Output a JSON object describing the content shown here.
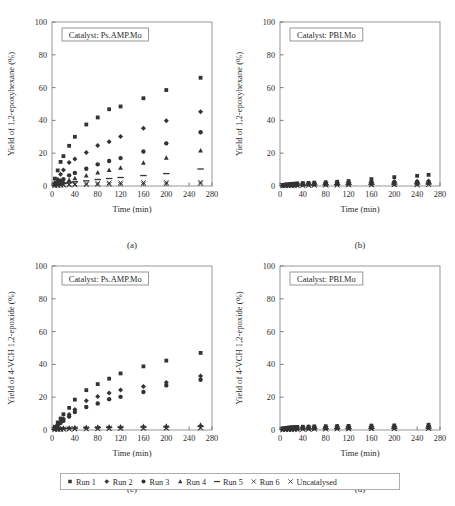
{
  "figure": {
    "background": "#ffffff",
    "marker_color": "#333333",
    "axis_color": "#8d8d8d"
  },
  "legend": {
    "items": [
      {
        "label": "Run 1",
        "marker": "square"
      },
      {
        "label": "Run 2",
        "marker": "diamond"
      },
      {
        "label": "Run 3",
        "marker": "circle"
      },
      {
        "label": "Run 4",
        "marker": "triangle"
      },
      {
        "label": "Run 5",
        "marker": "dash"
      },
      {
        "label": "Run 6",
        "marker": "cross"
      },
      {
        "label": "Uncatalysed",
        "marker": "cross"
      }
    ]
  },
  "panels": [
    {
      "letter": "(a)",
      "catalyst_label": "Catalyst: Ps.AMP.Mo",
      "chart_data": {
        "type": "scatter",
        "title": "",
        "xlabel": "Time (min)",
        "ylabel": "Yield of 1,2-epoxyhexane (%)",
        "xlim": [
          0,
          280
        ],
        "ylim": [
          0,
          100
        ],
        "xticks": [
          0,
          40,
          80,
          120,
          160,
          200,
          240,
          280
        ],
        "yticks": [
          0,
          20,
          40,
          60,
          80,
          100
        ],
        "grid": false,
        "legend_position": "below-figure",
        "x": [
          5,
          10,
          15,
          20,
          30,
          40,
          60,
          80,
          100,
          120,
          160,
          200,
          260
        ],
        "series": [
          {
            "name": "Run 1",
            "marker": "square",
            "values": [
              4.5,
              9.5,
              14.7,
              18.2,
              24.5,
              30.0,
              37.5,
              41.8,
              46.8,
              48.5,
              53.5,
              58.5,
              66.0
            ]
          },
          {
            "name": "Run 2",
            "marker": "diamond",
            "values": [
              2.0,
              4.0,
              7.2,
              9.8,
              14.4,
              16.5,
              20.5,
              24.7,
              27.0,
              30.2,
              35.2,
              39.8,
              45.3
            ]
          },
          {
            "name": "Run 3",
            "marker": "circle",
            "values": [
              1.2,
              2.2,
              3.2,
              4.2,
              6.5,
              8.0,
              10.5,
              13.2,
              15.2,
              17.0,
              21.0,
              26.0,
              32.8
            ]
          },
          {
            "name": "Run 4",
            "marker": "triangle",
            "values": [
              0.8,
              1.4,
              2.0,
              2.6,
              3.6,
              4.8,
              6.4,
              8.2,
              9.7,
              11.2,
              14.2,
              17.2,
              21.6
            ]
          },
          {
            "name": "Run 5",
            "marker": "dash",
            "values": [
              0.4,
              0.8,
              1.1,
              1.5,
              2.0,
              2.6,
              3.2,
              4.0,
              4.6,
              5.2,
              6.4,
              7.6,
              10.4
            ]
          },
          {
            "name": "Run 6",
            "marker": "cross",
            "values": [
              0.3,
              0.5,
              0.7,
              0.9,
              1.1,
              1.3,
              1.5,
              1.7,
              1.9,
              2.0,
              2.1,
              2.2,
              2.3
            ]
          },
          {
            "name": "Uncatalysed",
            "marker": "cross",
            "values": [
              0.2,
              0.3,
              0.4,
              0.5,
              0.6,
              0.7,
              0.8,
              0.9,
              1.0,
              1.1,
              1.2,
              1.3,
              1.4
            ]
          }
        ]
      }
    },
    {
      "letter": "(b)",
      "catalyst_label": "Catalyst: PBI.Mo",
      "chart_data": {
        "type": "scatter",
        "title": "",
        "xlabel": "Time (min)",
        "ylabel": "Yield of 1,2-epoxyhexane (%)",
        "xlim": [
          0,
          280
        ],
        "ylim": [
          0,
          100
        ],
        "xticks": [
          0,
          40,
          80,
          120,
          160,
          200,
          240,
          280
        ],
        "yticks": [
          0,
          20,
          40,
          60,
          80,
          100
        ],
        "grid": false,
        "legend_position": "below-figure",
        "x": [
          5,
          10,
          15,
          20,
          25,
          30,
          40,
          50,
          60,
          80,
          100,
          120,
          160,
          200,
          240,
          260
        ],
        "series": [
          {
            "name": "Run 1",
            "marker": "square",
            "values": [
              0.6,
              0.9,
              1.1,
              1.3,
              1.4,
              1.6,
              1.8,
              1.9,
              2.1,
              2.3,
              2.6,
              3.0,
              4.2,
              5.4,
              6.2,
              6.8
            ]
          },
          {
            "name": "Run 2",
            "marker": "diamond",
            "values": [
              0.5,
              0.7,
              0.9,
              1.0,
              1.1,
              1.2,
              1.4,
              1.5,
              1.6,
              1.8,
              2.0,
              2.2,
              2.6,
              2.8,
              2.9,
              3.0
            ]
          },
          {
            "name": "Run 3",
            "marker": "circle",
            "values": [
              0.4,
              0.6,
              0.7,
              0.8,
              0.9,
              1.0,
              1.1,
              1.2,
              1.3,
              1.4,
              1.6,
              1.8,
              2.0,
              2.1,
              2.2,
              2.3
            ]
          },
          {
            "name": "Run 4",
            "marker": "triangle",
            "values": [
              0.3,
              0.4,
              0.5,
              0.6,
              0.7,
              0.8,
              0.9,
              1.0,
              1.0,
              1.1,
              1.2,
              1.3,
              1.5,
              1.6,
              1.7,
              1.8
            ]
          },
          {
            "name": "Run 5",
            "marker": "dash",
            "values": [
              0.2,
              0.3,
              0.4,
              0.4,
              0.5,
              0.5,
              0.6,
              0.7,
              0.7,
              0.8,
              0.9,
              1.0,
              1.1,
              1.2,
              1.3,
              1.3
            ]
          },
          {
            "name": "Run 6",
            "marker": "cross",
            "values": [
              0.2,
              0.2,
              0.3,
              0.3,
              0.4,
              0.4,
              0.5,
              0.5,
              0.6,
              0.6,
              0.7,
              0.8,
              0.9,
              0.9,
              1.0,
              1.0
            ]
          },
          {
            "name": "Uncatalysed",
            "marker": "cross",
            "values": [
              0.1,
              0.1,
              0.2,
              0.2,
              0.2,
              0.3,
              0.3,
              0.4,
              0.4,
              0.5,
              0.5,
              0.6,
              0.6,
              0.7,
              0.7,
              0.8
            ]
          }
        ]
      }
    },
    {
      "letter": "(c)",
      "catalyst_label": "Catalyst: Ps.AMP.Mo",
      "chart_data": {
        "type": "scatter",
        "title": "",
        "xlabel": "Time (min)",
        "ylabel": "Yield of 4-VCH 1,2-epoxide (%)",
        "xlim": [
          0,
          280
        ],
        "ylim": [
          0,
          100
        ],
        "xticks": [
          0,
          40,
          80,
          120,
          160,
          200,
          240,
          280
        ],
        "yticks": [
          0,
          20,
          40,
          60,
          80,
          100
        ],
        "grid": false,
        "legend_position": "below-figure",
        "x": [
          5,
          10,
          15,
          20,
          30,
          40,
          60,
          80,
          100,
          120,
          160,
          200,
          260
        ],
        "series": [
          {
            "name": "Run 1",
            "marker": "square",
            "values": [
              2.0,
              4.6,
              7.0,
              9.6,
              13.5,
              18.5,
              24.3,
              28.0,
              31.3,
              34.5,
              38.8,
              42.3,
              47.0
            ]
          },
          {
            "name": "Run 2",
            "marker": "diamond",
            "values": [
              1.5,
              3.2,
              5.0,
              6.8,
              9.5,
              12.5,
              17.8,
              20.5,
              22.5,
              24.4,
              26.5,
              29.0,
              33.0
            ]
          },
          {
            "name": "Run 3",
            "marker": "circle",
            "values": [
              1.2,
              2.6,
              4.2,
              5.6,
              8.2,
              11.0,
              14.0,
              16.2,
              18.8,
              20.2,
              23.2,
              27.2,
              30.6
            ]
          },
          {
            "name": "Run 4",
            "marker": "triangle",
            "values": [
              0.6,
              0.9,
              1.1,
              1.3,
              1.5,
              1.7,
              1.9,
              2.0,
              2.1,
              2.2,
              2.4,
              2.6,
              3.2
            ]
          },
          {
            "name": "Run 5",
            "marker": "dash",
            "values": [
              0.4,
              0.6,
              0.8,
              0.9,
              1.1,
              1.2,
              1.4,
              1.5,
              1.6,
              1.7,
              1.8,
              1.9,
              2.2
            ]
          },
          {
            "name": "Run 6",
            "marker": "cross",
            "values": [
              0.3,
              0.4,
              0.5,
              0.6,
              0.7,
              0.8,
              0.9,
              1.0,
              1.1,
              1.2,
              1.3,
              1.4,
              1.6
            ]
          },
          {
            "name": "Uncatalysed",
            "marker": "cross",
            "values": [
              0.2,
              0.3,
              0.3,
              0.4,
              0.5,
              0.5,
              0.6,
              0.7,
              0.8,
              0.8,
              0.9,
              1.0,
              1.1
            ]
          }
        ]
      }
    },
    {
      "letter": "(d)",
      "catalyst_label": "Catalyst: PBI.Mo",
      "chart_data": {
        "type": "scatter",
        "title": "",
        "xlabel": "Time (min)",
        "ylabel": "Yield of 4-VCH 1,2-epoxide (%)",
        "xlim": [
          0,
          280
        ],
        "ylim": [
          0,
          100
        ],
        "xticks": [
          0,
          40,
          80,
          120,
          160,
          200,
          240,
          280
        ],
        "yticks": [
          0,
          20,
          40,
          60,
          80,
          100
        ],
        "grid": false,
        "legend_position": "below-figure",
        "x": [
          5,
          10,
          15,
          20,
          25,
          30,
          40,
          50,
          60,
          80,
          100,
          120,
          160,
          200,
          260
        ],
        "series": [
          {
            "name": "Run 1",
            "marker": "square",
            "values": [
              1.0,
              1.3,
              1.5,
              1.7,
              1.8,
              1.9,
              2.0,
              2.1,
              2.2,
              2.3,
              2.4,
              2.5,
              2.7,
              2.8,
              3.2
            ]
          },
          {
            "name": "Run 2",
            "marker": "diamond",
            "values": [
              0.8,
              1.0,
              1.2,
              1.3,
              1.4,
              1.5,
              1.6,
              1.7,
              1.8,
              1.9,
              2.0,
              2.1,
              2.2,
              2.3,
              2.5
            ]
          },
          {
            "name": "Run 3",
            "marker": "circle",
            "values": [
              0.6,
              0.8,
              0.9,
              1.0,
              1.1,
              1.2,
              1.3,
              1.4,
              1.4,
              1.5,
              1.6,
              1.7,
              1.8,
              1.9,
              2.0
            ]
          },
          {
            "name": "Run 4",
            "marker": "triangle",
            "values": [
              0.5,
              0.6,
              0.7,
              0.8,
              0.8,
              0.9,
              1.0,
              1.0,
              1.1,
              1.2,
              1.2,
              1.3,
              1.4,
              1.5,
              1.6
            ]
          },
          {
            "name": "Run 5",
            "marker": "dash",
            "values": [
              0.3,
              0.4,
              0.5,
              0.5,
              0.6,
              0.6,
              0.7,
              0.7,
              0.8,
              0.8,
              0.9,
              0.9,
              1.0,
              1.1,
              1.2
            ]
          },
          {
            "name": "Run 6",
            "marker": "cross",
            "values": [
              0.2,
              0.3,
              0.3,
              0.4,
              0.4,
              0.5,
              0.5,
              0.6,
              0.6,
              0.7,
              0.7,
              0.8,
              0.8,
              0.9,
              1.0
            ]
          },
          {
            "name": "Uncatalysed",
            "marker": "cross",
            "values": [
              0.1,
              0.2,
              0.2,
              0.2,
              0.3,
              0.3,
              0.4,
              0.4,
              0.5,
              0.5,
              0.6,
              0.6,
              0.7,
              0.7,
              0.8
            ]
          }
        ]
      }
    }
  ]
}
